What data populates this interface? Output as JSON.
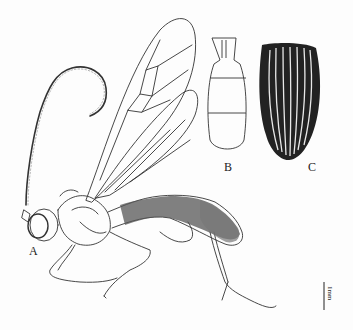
{
  "figure": {
    "panels": [
      {
        "id": "A",
        "label": "A",
        "description": "habitus, lateral view"
      },
      {
        "id": "B",
        "label": "B",
        "description": "abdominal segments, dorsal view"
      },
      {
        "id": "C",
        "label": "C",
        "description": "striated segment (elytra-like), dorsal view"
      }
    ],
    "scale_bar": {
      "label": "1mm"
    }
  },
  "colors": {
    "ink": "#222222",
    "background": "#fdfdfd",
    "shading": "#444444"
  }
}
